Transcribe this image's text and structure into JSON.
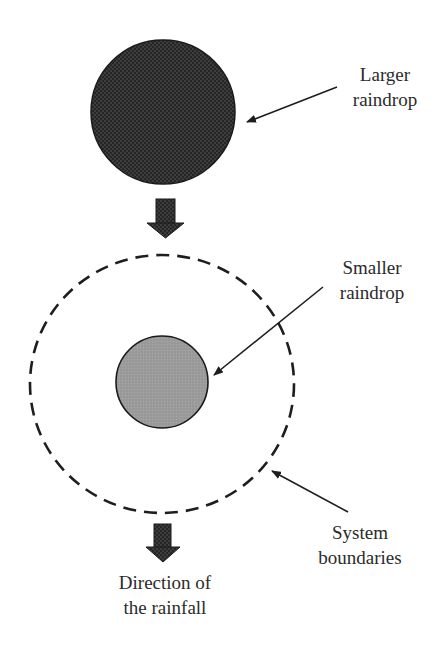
{
  "diagram": {
    "type": "raindrop-system-boundary",
    "labels": {
      "larger_raindrop": [
        "Larger",
        "raindrop"
      ],
      "smaller_raindrop": [
        "Smaller",
        "raindrop"
      ],
      "system_boundaries": [
        "System",
        "boundaries"
      ],
      "direction": [
        "Direction of",
        "the rainfall"
      ]
    },
    "colors": {
      "large_drop_fill": "#2b2b2b",
      "small_drop_fill": "#9a9a9a",
      "stroke": "#1e1e1e",
      "text": "#2b2b2b"
    }
  }
}
